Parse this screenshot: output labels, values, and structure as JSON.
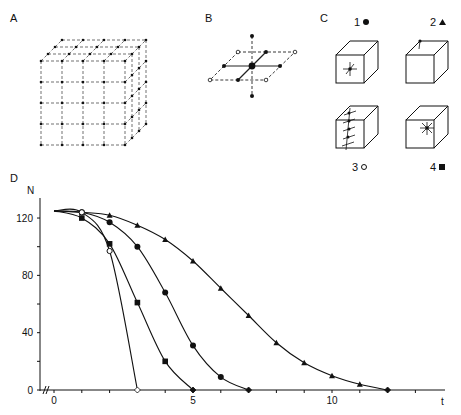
{
  "panels": {
    "A": {
      "label": "A",
      "description": "3D cubic lattice of points joined by dashed lines (5x5 front face, 4 layers deep)"
    },
    "B": {
      "label": "B",
      "description": "Single lattice node with six nearest neighbours; horizontal plane dashed, open circles at plane corners"
    },
    "C": {
      "label": "C",
      "items": [
        {
          "label": "1",
          "marker": "●",
          "marker_name": "filled-circle",
          "description": "cube with damage at centre of front face"
        },
        {
          "label": "2",
          "marker": "▲",
          "marker_name": "filled-triangle",
          "description": "cube with damage at top corner"
        },
        {
          "label": "3",
          "marker": "o",
          "marker_name": "open-circle",
          "description": "cube with damage along front vertical edge"
        },
        {
          "label": "4",
          "marker": "■",
          "marker_name": "filled-square",
          "description": "cube with damage at centre of top/side face"
        }
      ]
    },
    "D": {
      "label": "D"
    }
  },
  "chart_data": {
    "type": "line",
    "title": "",
    "xlabel": "t",
    "ylabel": "N",
    "xlim": [
      0,
      13
    ],
    "ylim": [
      0,
      130
    ],
    "x_ticks": [
      0,
      1,
      2,
      3,
      4,
      5,
      6,
      7,
      8,
      9,
      10,
      11,
      12,
      13
    ],
    "x_tick_labels": {
      "0": "0",
      "5": "5",
      "10": "10"
    },
    "y_ticks": [
      0,
      20,
      40,
      60,
      80,
      100,
      120
    ],
    "y_tick_labels": {
      "0": "0",
      "40": "40",
      "80": "80",
      "120": "120"
    },
    "axis_break": "// near origin on x-axis",
    "grid": false,
    "legend": "markers keyed to panel C (1 ●, 2 ▲, 3 o, 4 ■)",
    "series": [
      {
        "name": "1",
        "marker": "filled-circle",
        "x": [
          0,
          1,
          2,
          3,
          4,
          5,
          6,
          7
        ],
        "values": [
          125,
          124,
          117,
          100,
          68,
          31,
          9,
          0
        ]
      },
      {
        "name": "2",
        "marker": "filled-triangle",
        "x": [
          0,
          1,
          2,
          3,
          4,
          5,
          6,
          7,
          8,
          9,
          10,
          11,
          12
        ],
        "values": [
          125,
          124,
          122,
          115,
          105,
          90,
          71,
          52,
          33,
          19,
          10,
          4,
          0
        ]
      },
      {
        "name": "3",
        "marker": "open-circle",
        "x": [
          0,
          1,
          2,
          3
        ],
        "values": [
          125,
          124,
          97,
          0
        ]
      },
      {
        "name": "4",
        "marker": "filled-square",
        "x": [
          0,
          1,
          2,
          3,
          4,
          5
        ],
        "values": [
          125,
          120,
          102,
          61,
          20,
          0
        ]
      }
    ]
  }
}
